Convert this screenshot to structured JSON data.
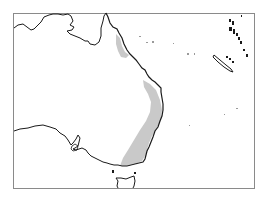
{
  "map": {
    "type": "distribution-range-map",
    "region": "Eastern Australia and southwest Pacific",
    "colors": {
      "background": "#ffffff",
      "frame": "#8a8a8a",
      "coastline": "#1a1a1a",
      "range_fill": "#c9c9c9"
    },
    "features": [
      {
        "name": "australia-mainland-coastline",
        "kind": "coastline"
      },
      {
        "name": "tasmania-coastline",
        "kind": "coastline"
      },
      {
        "name": "cape-york-range",
        "kind": "distribution-range"
      },
      {
        "name": "east-coast-range",
        "kind": "distribution-range"
      },
      {
        "name": "new-caledonia",
        "kind": "island"
      },
      {
        "name": "vanuatu-islands",
        "kind": "island-group"
      },
      {
        "name": "coral-sea-islets",
        "kind": "island-group"
      }
    ]
  }
}
